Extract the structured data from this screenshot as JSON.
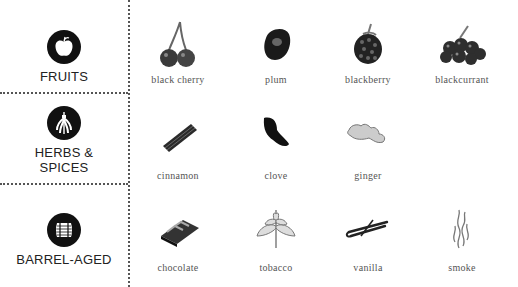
{
  "categories": [
    {
      "label": "FRUITS",
      "icon": "apple-icon"
    },
    {
      "label": "HERBS & SPICES",
      "label_lines": [
        "HERBS &",
        "SPICES"
      ],
      "icon": "herb-bundle-icon"
    },
    {
      "label": "BARREL-AGED",
      "icon": "barrel-icon"
    }
  ],
  "rows": [
    {
      "category": "FRUITS",
      "items": [
        {
          "name": "black cherry",
          "icon": "cherry-icon"
        },
        {
          "name": "plum",
          "icon": "plum-icon"
        },
        {
          "name": "blackberry",
          "icon": "blackberry-icon"
        },
        {
          "name": "blackcurrant",
          "icon": "blackcurrant-icon"
        }
      ]
    },
    {
      "category": "HERBS & SPICES",
      "items": [
        {
          "name": "cinnamon",
          "icon": "cinnamon-icon"
        },
        {
          "name": "clove",
          "icon": "clove-icon"
        },
        {
          "name": "ginger",
          "icon": "ginger-icon"
        }
      ]
    },
    {
      "category": "BARREL-AGED",
      "items": [
        {
          "name": "chocolate",
          "icon": "chocolate-icon"
        },
        {
          "name": "tobacco",
          "icon": "tobacco-leaf-icon"
        },
        {
          "name": "vanilla",
          "icon": "vanilla-bean-icon"
        },
        {
          "name": "smoke",
          "icon": "smoke-icon"
        }
      ]
    }
  ],
  "colors": {
    "badge": "#111111",
    "divider": "#555555",
    "label": "#222222",
    "item_text": "#555555"
  }
}
